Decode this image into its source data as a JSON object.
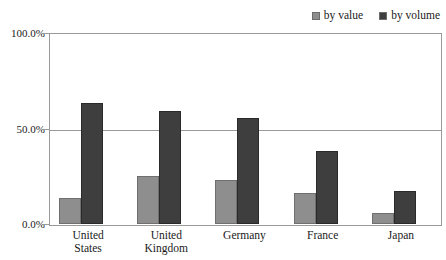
{
  "chart_data": {
    "type": "bar",
    "title": "",
    "xlabel": "",
    "ylabel": "",
    "categories": [
      "United States",
      "United Kingdom",
      "Germany",
      "France",
      "Japan"
    ],
    "series": [
      {
        "name": "by value",
        "color": "#8e8e8e",
        "values": [
          13.6,
          25.1,
          23.0,
          16.2,
          5.8
        ]
      },
      {
        "name": "by volume",
        "color": "#3e3e3e",
        "values": [
          63.4,
          59.2,
          55.5,
          38.2,
          17.3
        ]
      }
    ],
    "ylim": [
      0,
      100
    ],
    "yticks": [
      0,
      50,
      100
    ],
    "ytick_labels": [
      "0.0%",
      "50.0%",
      "100.0%"
    ],
    "grid": true,
    "legend_position": "top-right"
  },
  "legend": {
    "entries": [
      {
        "label": "by value",
        "swatch": "legend-swatch-by-value"
      },
      {
        "label": "by volume",
        "swatch": "legend-swatch-by-volume"
      }
    ]
  },
  "axis": {
    "y_labels": [
      "100.0%",
      "50.0%",
      "0.0%"
    ]
  },
  "categories": {
    "us": "United\nStates",
    "uk": "United\nKingdom",
    "de": "Germany",
    "fr": "France",
    "jp": "Japan"
  },
  "clipped_caption": ""
}
